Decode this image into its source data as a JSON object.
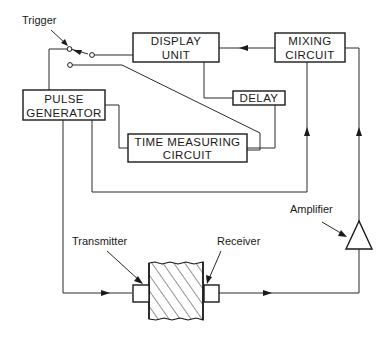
{
  "diagram": {
    "title": "",
    "labels": {
      "trigger": "Trigger",
      "amplifier": "Amplifier",
      "transmitter": "Transmitter",
      "receiver": "Receiver"
    },
    "blocks": {
      "display_unit": {
        "line1": "DISPLAY",
        "line2": "UNIT"
      },
      "mixing_circuit": {
        "line1": "MIXING",
        "line2": "CIRCUIT"
      },
      "delay": {
        "line1": "DELAY"
      },
      "pulse_generator": {
        "line1": "PULSE",
        "line2": "GENERATOR"
      },
      "time_measuring_circuit": {
        "line1": "TIME MEASURING",
        "line2": "CIRCUIT"
      }
    },
    "components": [
      "trigger-switch",
      "amplifier-triangle",
      "transmitter-probe",
      "receiver-probe",
      "test-specimen"
    ],
    "connections": [
      {
        "from": "mixing_circuit",
        "to": "display_unit",
        "arrow": true
      },
      {
        "from": "display_unit",
        "to": "delay",
        "arrow": false
      },
      {
        "from": "delay",
        "to": "time_measuring_circuit",
        "arrow": false
      },
      {
        "from": "pulse_generator",
        "to": "time_measuring_circuit",
        "arrow": false
      },
      {
        "from": "pulse_generator",
        "to": "mixing_circuit",
        "arrow": true
      },
      {
        "from": "pulse_generator",
        "to": "transmitter",
        "arrow": true
      },
      {
        "from": "receiver",
        "to": "amplifier",
        "arrow": true
      },
      {
        "from": "amplifier",
        "to": "mixing_circuit",
        "arrow": true
      },
      {
        "from": "trigger_switch",
        "to": "display_unit",
        "arrow": false
      },
      {
        "from": "trigger_switch",
        "to": "pulse_generator",
        "arrow": false
      },
      {
        "from": "trigger_switch",
        "to": "time_measuring_circuit",
        "arrow": false
      }
    ]
  }
}
